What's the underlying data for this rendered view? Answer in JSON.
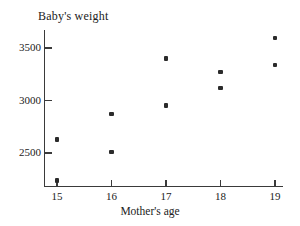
{
  "chart_data": {
    "type": "scatter",
    "title": "Baby's weight",
    "xlabel": "Mother's age",
    "ylabel": "Baby's weight",
    "xlim": [
      14.6,
      19.4
    ],
    "ylim": [
      2180,
      3660
    ],
    "grid": false,
    "legend": "none",
    "xticks": [
      15,
      16,
      17,
      18,
      19
    ],
    "xtick_labels": [
      "15",
      "16",
      "17",
      "18",
      "19"
    ],
    "yticks": [
      2500,
      3000,
      3500
    ],
    "ytick_labels": [
      "2500",
      "3000",
      "3500"
    ],
    "marker": "filled-square",
    "marker_color": "#2b2b2b",
    "axis_color": "#3a3a3a",
    "x": [
      15,
      15,
      16,
      16,
      17,
      17,
      18,
      18,
      19,
      19
    ],
    "y": [
      2630,
      2240,
      2870,
      2510,
      3400,
      2950,
      3270,
      3120,
      3595,
      3340
    ],
    "points": [
      {
        "x": 15,
        "y": 2630
      },
      {
        "x": 15,
        "y": 2240
      },
      {
        "x": 16,
        "y": 2870
      },
      {
        "x": 16,
        "y": 2510
      },
      {
        "x": 17,
        "y": 3400
      },
      {
        "x": 17,
        "y": 2950
      },
      {
        "x": 18,
        "y": 3270
      },
      {
        "x": 18,
        "y": 3120
      },
      {
        "x": 19,
        "y": 3595
      },
      {
        "x": 19,
        "y": 3340
      }
    ]
  }
}
